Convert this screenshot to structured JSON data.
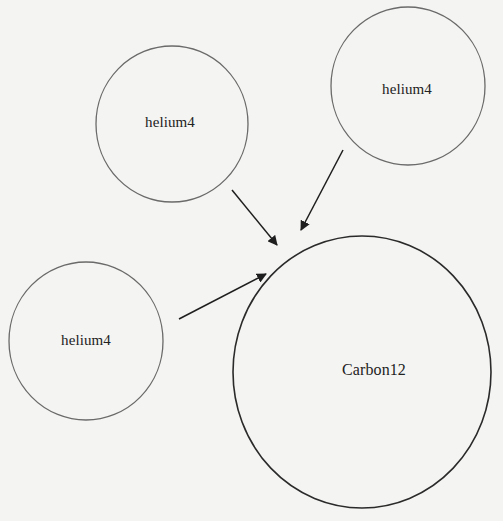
{
  "diagram": {
    "type": "reaction",
    "nodes": [
      {
        "id": "he4_a",
        "label": "helium4",
        "cx": 172,
        "cy": 124,
        "rx": 76,
        "ry": 78
      },
      {
        "id": "he4_b",
        "label": "helium4",
        "cx": 408,
        "cy": 86,
        "rx": 77,
        "ry": 79
      },
      {
        "id": "he4_c",
        "label": "helium4",
        "cx": 86,
        "cy": 341,
        "rx": 77,
        "ry": 79
      },
      {
        "id": "c12",
        "label": "Carbon12",
        "cx": 362,
        "cy": 372,
        "rx": 129,
        "ry": 136
      }
    ],
    "edges": [
      {
        "from": "he4_a",
        "to": "c12"
      },
      {
        "from": "he4_b",
        "to": "c12"
      },
      {
        "from": "he4_c",
        "to": "c12"
      }
    ],
    "colors": {
      "background": "#f4f4f2",
      "helium_stroke": "#6a6a6a",
      "carbon_stroke": "#2a2a2a",
      "arrow": "#1e1e1e",
      "text": "#222222"
    }
  }
}
